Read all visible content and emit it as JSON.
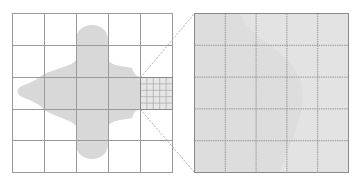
{
  "figure": {
    "colors": {
      "background": "#ffffff",
      "grid_line": "#9a9a9a",
      "region_fill": "#d8d8d8",
      "fine_grid_line": "#a8a8a8",
      "zoom_fill": "#e3e3e3",
      "zoom_region_fill": "#d9d9d9",
      "zoom_line": "#999999"
    },
    "left_grid": {
      "rows": 5,
      "cols": 5,
      "x": 12,
      "y": 13,
      "cell": 32
    },
    "refined_cell": {
      "row": 3,
      "col": 5,
      "subdivisions": 5
    },
    "right_grid": {
      "rows": 5,
      "cols": 5,
      "x": 194,
      "y": 13,
      "width": 154,
      "height": 159
    }
  }
}
